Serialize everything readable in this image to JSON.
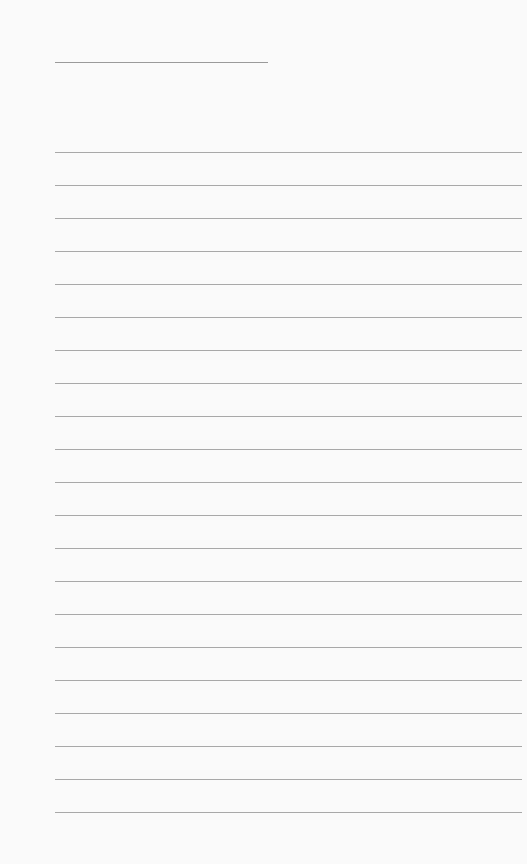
{
  "paper": {
    "background_color": "#fafafa",
    "line_color": "#a8a8a8",
    "title_line": {
      "y": 62,
      "x_start": 55,
      "x_end": 268
    },
    "ruled_lines": {
      "count": 21,
      "first_y": 152,
      "spacing": 33,
      "x_start": 55,
      "x_end": 522
    }
  }
}
